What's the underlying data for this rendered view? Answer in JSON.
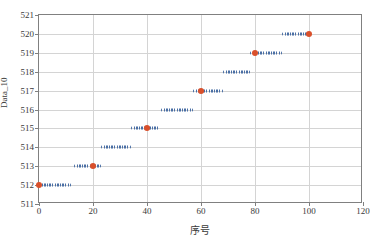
{
  "chart_data": {
    "type": "scatter",
    "title": "",
    "xlabel": "序号",
    "ylabel": "Data_10",
    "xlim": [
      0,
      120
    ],
    "ylim": [
      511,
      521
    ],
    "xticks": [
      0,
      20,
      40,
      60,
      80,
      100,
      120
    ],
    "yticks": [
      511,
      512,
      513,
      514,
      515,
      516,
      517,
      518,
      519,
      520,
      521
    ],
    "grid": true,
    "legend": "none",
    "series": [
      {
        "name": "Data_10",
        "color": "#4a6fa5",
        "description": "Dense dotted horizontal step segments rising one unit at a time",
        "steps": [
          {
            "value": 512,
            "x_start": 0,
            "x_end": 12
          },
          {
            "value": 513,
            "x_start": 13,
            "x_end": 23
          },
          {
            "value": 514,
            "x_start": 23,
            "x_end": 34
          },
          {
            "value": 515,
            "x_start": 34,
            "x_end": 45
          },
          {
            "value": 516,
            "x_start": 45,
            "x_end": 57
          },
          {
            "value": 517,
            "x_start": 57,
            "x_end": 68
          },
          {
            "value": 518,
            "x_start": 68,
            "x_end": 78
          },
          {
            "value": 519,
            "x_start": 78,
            "x_end": 90
          },
          {
            "value": 520,
            "x_start": 90,
            "x_end": 100
          }
        ]
      },
      {
        "name": "highlight-markers",
        "color": "#d9502b",
        "description": "Red circular markers at every 20th sequence index",
        "points": [
          {
            "x": 0,
            "y": 512
          },
          {
            "x": 20,
            "y": 513
          },
          {
            "x": 40,
            "y": 515
          },
          {
            "x": 60,
            "y": 517
          },
          {
            "x": 80,
            "y": 519
          },
          {
            "x": 100,
            "y": 520
          }
        ]
      }
    ]
  },
  "colors": {
    "data_blue": "#4a6fa5",
    "marker_red": "#d9502b",
    "grid": "#d4d4d4",
    "axis": "#808080",
    "text": "#3a3a3a",
    "background": "#ffffff"
  }
}
